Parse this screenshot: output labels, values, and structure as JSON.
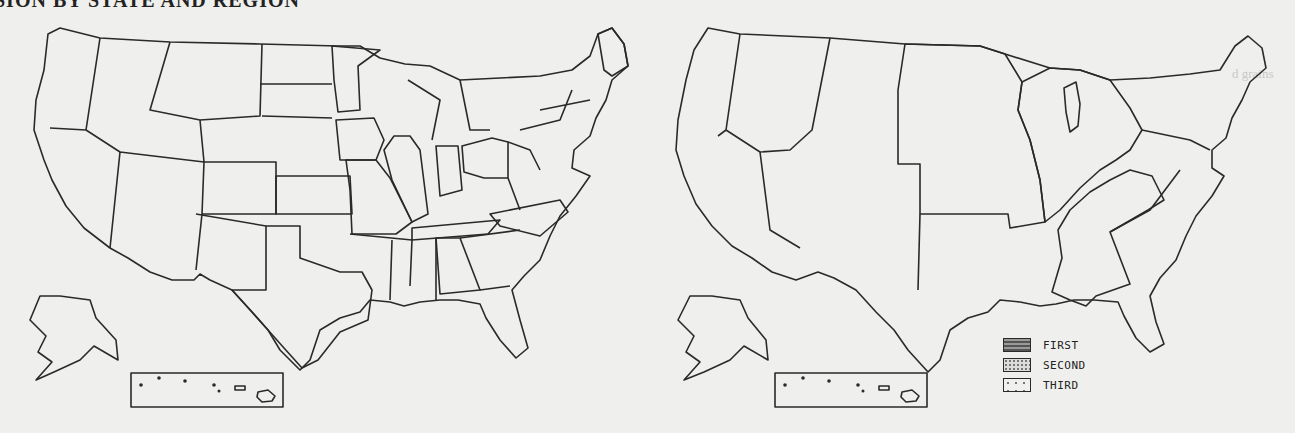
{
  "document": {
    "title_partial": "SION BY STATE AND REGION",
    "bleed_through": [
      "d grains",
      "ning b"
    ]
  },
  "maps": [
    {
      "id": "by-state",
      "label": "By State",
      "shaded_states": [
        "Minnesota",
        "Iowa",
        "Missouri",
        "Illinois",
        "Indiana",
        "Ohio",
        "Kansas",
        "Colorado",
        "Texas",
        "Tennessee",
        "North Carolina",
        "Alabama",
        "Maine"
      ],
      "inset": "Hawaii"
    },
    {
      "id": "by-region",
      "label": "By Region",
      "regions": [
        {
          "name": "FIRST",
          "states": [
            "North Dakota",
            "South Dakota",
            "Nebraska",
            "Kansas",
            "Minnesota",
            "Iowa",
            "Missouri"
          ]
        },
        {
          "name": "SECOND",
          "states": [
            "Wisconsin",
            "Michigan",
            "Illinois",
            "Indiana",
            "Ohio"
          ]
        },
        {
          "name": "THIRD",
          "states": [
            "Kentucky",
            "Tennessee",
            "Alabama",
            "Mississippi"
          ]
        }
      ],
      "inset": "Hawaii"
    }
  ],
  "legend": {
    "items": [
      {
        "label": "FIRST",
        "pattern": "brick-dark"
      },
      {
        "label": "SECOND",
        "pattern": "dense-dots"
      },
      {
        "label": "THIRD",
        "pattern": "sparse-dots"
      }
    ]
  },
  "colors": {
    "paper": "#efefed",
    "ink": "#2a2a2a",
    "state_shade": "#c4c4c2",
    "first": "#6a6a6a",
    "second": "#c0c0be",
    "third": "#e2e2df"
  }
}
